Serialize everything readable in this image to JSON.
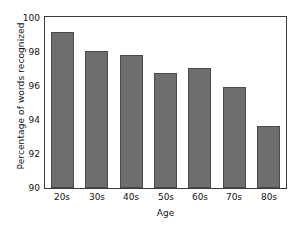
{
  "chart_data": {
    "type": "bar",
    "title": "",
    "subtitle": "",
    "categories": [
      "20s",
      "30s",
      "40s",
      "50s",
      "60s",
      "70s",
      "80s"
    ],
    "values": [
      99.1,
      98.0,
      97.8,
      96.7,
      97.0,
      95.9,
      93.6
    ],
    "series": [
      {
        "name": "Percentage of words recognized",
        "values": [
          99.1,
          98.0,
          97.8,
          96.7,
          97.0,
          95.9,
          93.6
        ]
      }
    ],
    "xlabel": "Age",
    "ylabel": "Percentage of words recognized",
    "ylim": [
      90,
      100
    ],
    "yticks": [
      100,
      98,
      96,
      94,
      92,
      90
    ],
    "ytick_labels": [
      "100",
      "98",
      "96",
      "94",
      "92",
      "90"
    ],
    "xtick_labels": [
      "20s",
      "30s",
      "40s",
      "50s",
      "60s",
      "70s",
      "80s"
    ],
    "grid": false,
    "legend": false,
    "legend_position": "none",
    "annotations": [],
    "colors": {
      "bar_fill": "#6e6e6e",
      "bar_edge": "#4a4a4a",
      "axis": "#3a3a3a",
      "text": "#121212",
      "background": "#ffffff"
    }
  }
}
